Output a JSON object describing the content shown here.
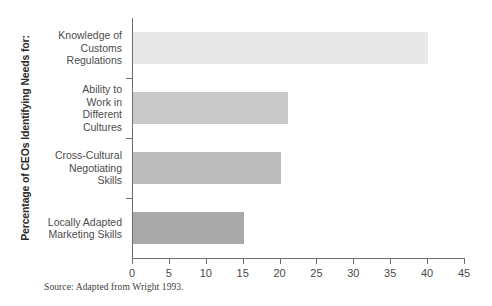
{
  "chart_data": {
    "type": "bar",
    "orientation": "horizontal",
    "title": "",
    "xlabel": "",
    "ylabel": "Percentage of CEOs Identifying Needs for:",
    "categories": [
      "Knowledge of\nCustoms\nRegulations",
      "Ability to\nWork in\nDifferent\nCultures",
      "Cross-Cultural\nNegotiating\nSkills",
      "Locally Adapted\nMarketing Skills"
    ],
    "values": [
      40,
      21,
      20,
      15
    ],
    "xlim": [
      0,
      45
    ],
    "xticks": [
      0,
      5,
      10,
      15,
      20,
      25,
      30,
      35,
      40,
      45
    ],
    "xticklabels": [
      "0",
      "5",
      "10",
      "15",
      "20",
      "25",
      "30",
      "35",
      "40",
      "45"
    ],
    "grid": false,
    "legend": null,
    "bar_colors": [
      "#e8e8e8",
      "#c9c9c9",
      "#bcbcbc",
      "#a9a9a9"
    ],
    "axis_color": "#6e6e6e"
  },
  "notes": {
    "source": "Source: Adapted from Wright 1993."
  }
}
